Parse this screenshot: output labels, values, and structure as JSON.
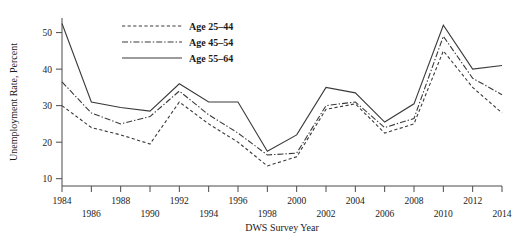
{
  "chart_data": {
    "type": "line",
    "title": "",
    "xlabel": "DWS Survey Year",
    "ylabel": "Unemployment Rate, Percent",
    "x": [
      1984,
      1986,
      1988,
      1990,
      1992,
      1994,
      1996,
      1998,
      2000,
      2002,
      2004,
      2006,
      2008,
      2010,
      2012,
      2014
    ],
    "xlim": [
      1984,
      2014
    ],
    "ylim": [
      8,
      54
    ],
    "grid": false,
    "legend_position": "top-center",
    "xticks": [
      1984,
      1986,
      1988,
      1990,
      1992,
      1994,
      1996,
      1998,
      2000,
      2002,
      2004,
      2006,
      2008,
      2010,
      2012,
      2014
    ],
    "yticks": [
      10,
      20,
      30,
      40,
      50
    ],
    "series": [
      {
        "name": "Age 25–44",
        "style": "dashed",
        "values": [
          30.0,
          24.0,
          22.0,
          19.5,
          31.0,
          25.0,
          20.0,
          13.5,
          16.0,
          29.0,
          30.5,
          22.5,
          25.0,
          45.0,
          35.0,
          28.0
        ]
      },
      {
        "name": "Age 45–54",
        "style": "dash-dot",
        "values": [
          36.5,
          28.0,
          25.0,
          27.0,
          34.0,
          27.5,
          22.5,
          16.5,
          17.0,
          30.0,
          31.0,
          24.0,
          26.5,
          49.0,
          37.5,
          33.0
        ]
      },
      {
        "name": "Age 55–64",
        "style": "solid",
        "values": [
          52.5,
          31.0,
          29.5,
          28.5,
          36.0,
          31.0,
          31.0,
          17.5,
          22.0,
          35.0,
          33.5,
          25.5,
          30.5,
          52.0,
          40.0,
          41.0
        ]
      }
    ]
  },
  "axis": {
    "y_label": "Unemployment Rate, Percent",
    "x_label": "DWS Survey Year",
    "y_ticks": [
      "10",
      "20",
      "30",
      "40",
      "50"
    ],
    "x_ticks_row_top": [
      "1984",
      "1988",
      "1992",
      "1996",
      "2000",
      "2004",
      "2008",
      "2012"
    ],
    "x_ticks_row_bottom": [
      "1986",
      "1990",
      "1994",
      "1998",
      "2002",
      "2006",
      "2010",
      "2014"
    ]
  },
  "legend": {
    "items": [
      {
        "label": "Age 25–44",
        "style": "dashed"
      },
      {
        "label": "Age 45–54",
        "style": "dash-dot"
      },
      {
        "label": "Age 55–64",
        "style": "solid"
      }
    ]
  },
  "colors": {
    "line": "#3a3a3a",
    "axis": "#4a4a4a",
    "text": "#1a1a1a",
    "background": "#ffffff"
  }
}
